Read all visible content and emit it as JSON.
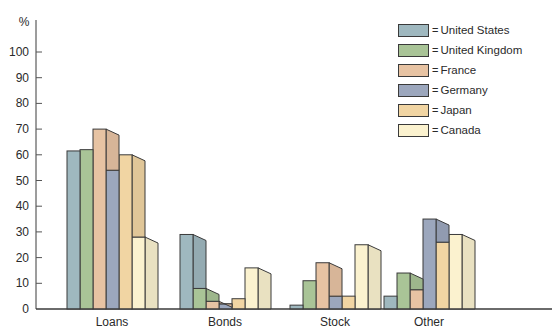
{
  "chart_data": {
    "type": "bar",
    "title": "",
    "xlabel": "",
    "ylabel": "%",
    "ylim": [
      0,
      100
    ],
    "yticks": [
      0,
      10,
      20,
      30,
      40,
      50,
      60,
      70,
      80,
      90,
      100
    ],
    "categories": [
      "Loans",
      "Bonds",
      "Stock",
      "Other"
    ],
    "series": [
      {
        "name": "United States",
        "color": "#9fb8bf",
        "values": [
          61.5,
          29,
          1.5,
          5
        ]
      },
      {
        "name": "United Kingdom",
        "color": "#a9c497",
        "values": [
          62,
          8,
          11,
          14
        ]
      },
      {
        "name": "France",
        "color": "#e7c3a3",
        "values": [
          70,
          3,
          18,
          7.5
        ]
      },
      {
        "name": "Germany",
        "color": "#9ca7bd",
        "values": [
          54,
          2,
          5,
          35
        ]
      },
      {
        "name": "Japan",
        "color": "#f1d5a3",
        "values": [
          60,
          4,
          5,
          26
        ]
      },
      {
        "name": "Canada",
        "color": "#fbf2cf",
        "values": [
          28,
          16,
          25,
          29
        ]
      }
    ],
    "legend_position": "top-right",
    "grid": false,
    "legend_prefix": "="
  }
}
